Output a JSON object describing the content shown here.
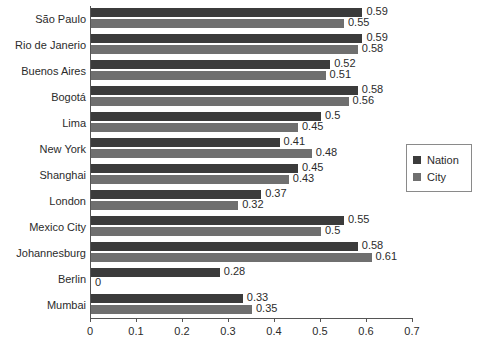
{
  "chart_data": {
    "type": "bar",
    "orientation": "horizontal",
    "title": "",
    "xlabel": "",
    "ylabel": "",
    "xlim": [
      0,
      0.7
    ],
    "xticks": [
      "0",
      "0.1",
      "0.2",
      "0.3",
      "0.4",
      "0.5",
      "0.6",
      "0.7"
    ],
    "xtick_values": [
      0,
      0.1,
      0.2,
      0.3,
      0.4,
      0.5,
      0.6,
      0.7
    ],
    "grid": false,
    "legend_position": "right",
    "categories": [
      "São Paulo",
      "Rio de Janerio",
      "Buenos Aires",
      "Bogotá",
      "Lima",
      "New York",
      "Shanghai",
      "London",
      "Mexico City",
      "Johannesburg",
      "Berlin",
      "Mumbai"
    ],
    "series": [
      {
        "name": "Nation",
        "color": "#3b3b3b",
        "values": [
          0.59,
          0.59,
          0.52,
          0.58,
          0.5,
          0.41,
          0.45,
          0.37,
          0.55,
          0.58,
          0.28,
          0.33
        ],
        "labels": [
          "0.59",
          "0.59",
          "0.52",
          "0.58",
          "0.5",
          "0.41",
          "0.45",
          "0.37",
          "0.55",
          "0.58",
          "0.28",
          "0.33"
        ]
      },
      {
        "name": "City",
        "color": "#6f6f6f",
        "values": [
          0.55,
          0.58,
          0.51,
          0.56,
          0.45,
          0.48,
          0.43,
          0.32,
          0.5,
          0.61,
          0,
          0.35
        ],
        "labels": [
          "0.55",
          "0.58",
          "0.51",
          "0.56",
          "0.45",
          "0.48",
          "0.43",
          "0.32",
          "0.5",
          "0.61",
          "0",
          "0.35"
        ]
      }
    ]
  },
  "legend": {
    "items": [
      {
        "label": "Nation",
        "color": "#3b3b3b"
      },
      {
        "label": "City",
        "color": "#6f6f6f"
      }
    ]
  }
}
